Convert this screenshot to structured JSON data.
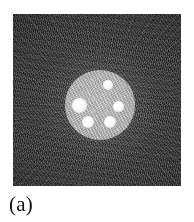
{
  "figure": {
    "caption": "(a)",
    "panel_label": "a",
    "image_type": "grayscale reconstructed tomographic image",
    "background_description": "dark speckled noise with radial streak artifacts",
    "colors": {
      "page_background": "#ffffff",
      "image_background": "#2f2f2f",
      "phantom_fill": "#c6c6c6",
      "inclusion_fill": "#ffffff",
      "caption_text": "#111111"
    },
    "frame": {
      "x": 13,
      "y": 14,
      "width": 168,
      "height": 172
    },
    "phantom": {
      "label": "circular phantom disc",
      "center_x": 100,
      "center_y": 105,
      "radius": 35
    },
    "inclusions": [
      {
        "name": "inclusion-top",
        "cx": 108,
        "cy": 85,
        "r": 5.0
      },
      {
        "name": "inclusion-left",
        "cx": 79,
        "cy": 105,
        "r": 7.5
      },
      {
        "name": "inclusion-right",
        "cx": 118,
        "cy": 106,
        "r": 5.5
      },
      {
        "name": "inclusion-bottom-left",
        "cx": 88,
        "cy": 122,
        "r": 6.0
      },
      {
        "name": "inclusion-bottom-right",
        "cx": 110,
        "cy": 122,
        "r": 6.0
      }
    ]
  }
}
